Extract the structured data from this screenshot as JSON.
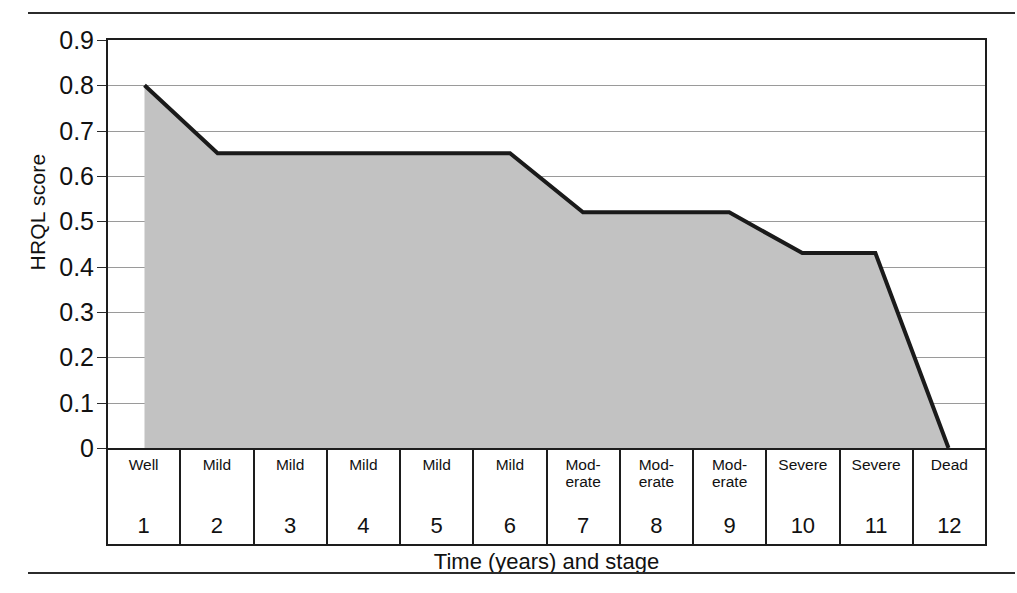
{
  "figure": {
    "rules": {
      "top": "horizontal-rule",
      "bottom": "horizontal-rule"
    }
  },
  "chart_data": {
    "type": "area",
    "title": "",
    "xlabel": "Time (years) and stage",
    "ylabel": "HRQL score",
    "ylim": [
      0,
      0.9
    ],
    "xlim": [
      1,
      12
    ],
    "grid": true,
    "legend": "none",
    "fill_color": "#c2c2c2",
    "line_color": "#1a1a1a",
    "x": [
      1,
      2,
      3,
      4,
      5,
      6,
      7,
      8,
      9,
      10,
      11,
      12
    ],
    "values": [
      0.8,
      0.65,
      0.65,
      0.65,
      0.65,
      0.65,
      0.52,
      0.52,
      0.52,
      0.43,
      0.43,
      0
    ],
    "categories": [
      "Well",
      "Mild",
      "Mild",
      "Mild",
      "Mild",
      "Mild",
      "Mod-\nerate",
      "Mod-\nerate",
      "Mod-\nerate",
      "Severe",
      "Severe",
      "Dead"
    ],
    "year_labels": [
      "1",
      "2",
      "3",
      "4",
      "5",
      "6",
      "7",
      "8",
      "9",
      "10",
      "11",
      "12"
    ],
    "ytick_labels": [
      "0.9",
      "0.8",
      "0.7",
      "0.6",
      "0.5",
      "0.4",
      "0.3",
      "0.2",
      "0.1",
      "0"
    ],
    "ytick_values": [
      0.9,
      0.8,
      0.7,
      0.6,
      0.5,
      0.4,
      0.3,
      0.2,
      0.1,
      0
    ]
  }
}
